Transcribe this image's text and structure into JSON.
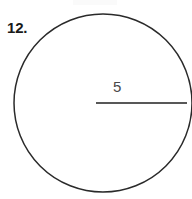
{
  "figure": {
    "problem_number": "12.",
    "radius_label": "5",
    "background_color": "#ffffff",
    "circle": {
      "stroke_color": "#2a2a2a",
      "stroke_width": 1.5,
      "center_x": 103,
      "center_y": 103,
      "radius": 89,
      "fill": "none"
    },
    "radius_segment": {
      "stroke_color": "#585858",
      "stroke_width": 2,
      "x1": 96,
      "y1": 103,
      "x2": 187,
      "y2": 103
    },
    "number_color": "#1a1a1a",
    "label_color": "#4a4a4a"
  }
}
